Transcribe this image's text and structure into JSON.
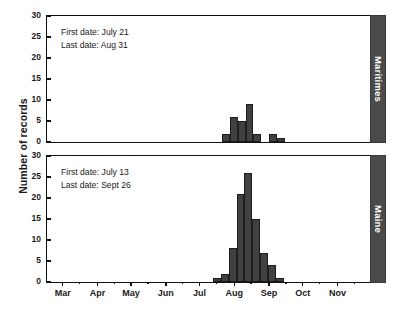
{
  "chart_data": {
    "type": "bar",
    "title": "",
    "xlabel": "",
    "ylabel": "Number of records",
    "ylim": [
      0,
      30
    ],
    "yticks": [
      0,
      5,
      10,
      15,
      20,
      25,
      30
    ],
    "ytick_labels": [
      "0",
      "5",
      "10",
      "15",
      "20",
      "25",
      "30"
    ],
    "grid": false,
    "legend": "none",
    "x_axis": {
      "type": "month",
      "range": [
        "Feb 15",
        "Nov 30"
      ],
      "tick_labels": [
        "Mar",
        "Apr",
        "May",
        "Jun",
        "Jul",
        "Aug",
        "Sep",
        "Oct",
        "Nov"
      ],
      "minor_ticks": true
    },
    "panels": [
      {
        "id": "maritimes",
        "label": "Maritimes",
        "annotations": [
          "First date: July 21",
          "Last date: Aug 31"
        ],
        "first_date": "July 21",
        "last_date": "Aug 31",
        "bins": [
          {
            "x": "Jul 21",
            "value": 2
          },
          {
            "x": "Jul 28",
            "value": 6
          },
          {
            "x": "Aug 4",
            "value": 5
          },
          {
            "x": "Aug 11",
            "value": 9
          },
          {
            "x": "Aug 18",
            "value": 2
          },
          {
            "x": "Aug 25",
            "value": 0
          },
          {
            "x": "Sep 1",
            "value": 2
          },
          {
            "x": "Sep 8",
            "value": 1
          }
        ],
        "values": [
          2,
          6,
          5,
          9,
          2,
          0,
          2,
          1
        ],
        "total": 27,
        "max": 9
      },
      {
        "id": "maine",
        "label": "Maine",
        "annotations": [
          "First date: July 13",
          "Last date: Sept 26"
        ],
        "first_date": "July 13",
        "last_date": "Sept 26",
        "bins": [
          {
            "x": "Jul 13",
            "value": 1
          },
          {
            "x": "Jul 20",
            "value": 2
          },
          {
            "x": "Jul 27",
            "value": 8
          },
          {
            "x": "Aug 3",
            "value": 21
          },
          {
            "x": "Aug 10",
            "value": 26
          },
          {
            "x": "Aug 17",
            "value": 15
          },
          {
            "x": "Aug 24",
            "value": 7
          },
          {
            "x": "Aug 31",
            "value": 4
          },
          {
            "x": "Sep 7",
            "value": 1
          }
        ],
        "values": [
          1,
          2,
          8,
          21,
          26,
          15,
          7,
          4,
          1
        ],
        "total": 85,
        "max": 26
      }
    ],
    "colors": {
      "bar_fill": "#404040",
      "bar_edge": "#1d1d1d",
      "strip_fill": "#4a4a4a",
      "strip_text": "#ffffff",
      "axis": "#111111",
      "background": "#ffffff"
    }
  }
}
